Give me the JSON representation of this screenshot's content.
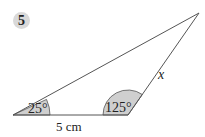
{
  "problem": {
    "number": "5"
  },
  "diagram": {
    "type": "triangle",
    "vertices": {
      "A": [
        13,
        115
      ],
      "B": [
        128,
        115
      ],
      "C": [
        199,
        13
      ]
    },
    "angles": [
      {
        "vertex": "A",
        "label": "25°",
        "value": 25
      },
      {
        "vertex": "B",
        "label": "125°",
        "value": 125
      }
    ],
    "sides": [
      {
        "between": "A-B",
        "label": "5 cm"
      },
      {
        "between": "B-C",
        "label": "x"
      }
    ],
    "colors": {
      "line": "#555555",
      "angle_fill": "#cfcfcf",
      "badge_fill": "#d9d9d9"
    }
  }
}
